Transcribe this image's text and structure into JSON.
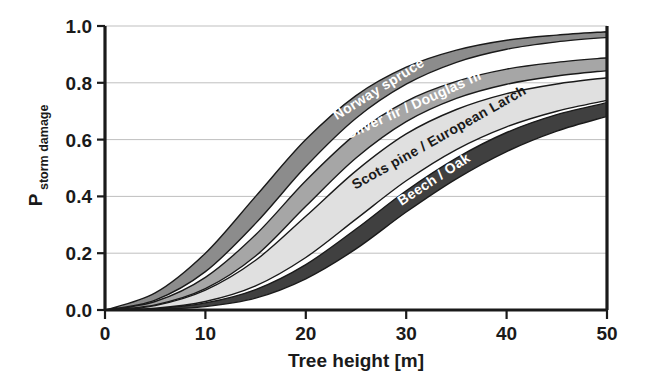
{
  "chart_data": {
    "type": "area",
    "title": "",
    "subtitle": "",
    "xlabel": "Tree height [m]",
    "ylabel_main": "P",
    "ylabel_sub": "storm damage",
    "ylabel": "P storm damage",
    "xlim": [
      0,
      50
    ],
    "ylim": [
      0,
      1.0
    ],
    "xticks": [
      0,
      10,
      20,
      30,
      40,
      50
    ],
    "xtick_labels": [
      "0",
      "10",
      "20",
      "30",
      "40",
      "50"
    ],
    "yticks": [
      0.0,
      0.2,
      0.4,
      0.6,
      0.8,
      1.0
    ],
    "ytick_labels": [
      "0.0",
      "0.2",
      "0.4",
      "0.6",
      "0.8",
      "1.0"
    ],
    "grid": "horizontal",
    "legend_position": "inline-on-band",
    "x": [
      0,
      5,
      10,
      15,
      20,
      25,
      30,
      35,
      40,
      45,
      50
    ],
    "series": [
      {
        "name": "Norway spruce",
        "label": "Norway spruce",
        "color": "#8c8c8c",
        "label_color": "#ffffff",
        "upper": [
          0.0,
          0.06,
          0.2,
          0.4,
          0.6,
          0.755,
          0.855,
          0.915,
          0.95,
          0.968,
          0.98
        ],
        "lower": [
          0.0,
          0.035,
          0.135,
          0.305,
          0.505,
          0.675,
          0.795,
          0.872,
          0.918,
          0.944,
          0.96
        ]
      },
      {
        "name": "Silver fir / Douglas fir",
        "label": "Silver fir / Douglas fir",
        "color": "#a6a6a6",
        "label_color": "#ffffff",
        "upper": [
          0.0,
          0.03,
          0.115,
          0.265,
          0.455,
          0.62,
          0.735,
          0.805,
          0.848,
          0.872,
          0.888
        ],
        "lower": [
          0.0,
          0.018,
          0.075,
          0.19,
          0.365,
          0.535,
          0.663,
          0.745,
          0.795,
          0.824,
          0.843
        ]
      },
      {
        "name": "Scots pine / European Larch",
        "label": "Scots pine / European Larch",
        "color": "#e0e0e0",
        "label_color": "#1a1a1a",
        "upper": [
          0.0,
          0.016,
          0.07,
          0.175,
          0.33,
          0.49,
          0.62,
          0.706,
          0.762,
          0.796,
          0.818
        ],
        "lower": [
          0.0,
          0.006,
          0.03,
          0.085,
          0.185,
          0.32,
          0.455,
          0.565,
          0.645,
          0.7,
          0.738
        ]
      },
      {
        "name": "Beech / Oak",
        "label": "Beech / Oak",
        "color": "#404040",
        "label_color": "#ffffff",
        "upper": [
          0.0,
          0.005,
          0.025,
          0.072,
          0.16,
          0.285,
          0.42,
          0.535,
          0.625,
          0.688,
          0.73
        ],
        "lower": [
          0.0,
          0.002,
          0.012,
          0.042,
          0.11,
          0.215,
          0.345,
          0.462,
          0.558,
          0.63,
          0.682
        ]
      }
    ],
    "colors": {
      "norway_spruce": "#8c8c8c",
      "silver_fir_douglas_fir": "#a6a6a6",
      "scots_pine_european_larch": "#e0e0e0",
      "beech_oak": "#404040",
      "axis": "#1a1a1a",
      "grid": "#bfbfbf",
      "background": "#ffffff"
    }
  }
}
